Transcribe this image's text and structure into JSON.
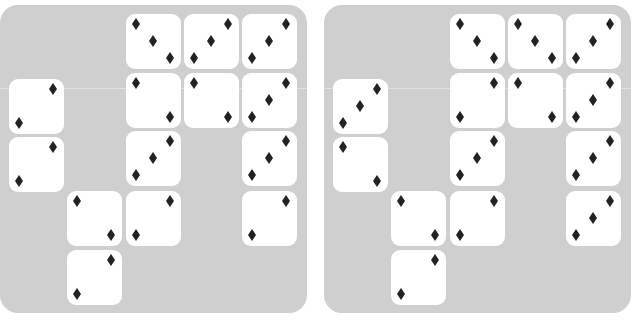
{
  "colors": {
    "panel_background": "#cfcfcf",
    "tile_background": "#ffffff",
    "pip_color": "#222222"
  },
  "pip_icon": "diamond-icon",
  "grid": {
    "columns_x": [
      9,
      67,
      126,
      184,
      242
    ],
    "rows_y": [
      9,
      68,
      126,
      186,
      245
    ],
    "col0_rows_y": [
      74,
      132
    ],
    "tile_size": 55
  },
  "panels": [
    {
      "name": "left",
      "caption": "",
      "tiles": [
        {
          "col": 2,
          "row": 0,
          "pattern": "diag-down-3"
        },
        {
          "col": 3,
          "row": 0,
          "pattern": "diag-up-3"
        },
        {
          "col": 4,
          "row": 0,
          "pattern": "diag-up-3"
        },
        {
          "col": 0,
          "row": 1,
          "pattern": "diag-up-2"
        },
        {
          "col": 2,
          "row": 1,
          "pattern": "diag-down-2"
        },
        {
          "col": 3,
          "row": 1,
          "pattern": "diag-down-2"
        },
        {
          "col": 4,
          "row": 1,
          "pattern": "diag-up-3"
        },
        {
          "col": 0,
          "row": 2,
          "pattern": "diag-up-2"
        },
        {
          "col": 2,
          "row": 2,
          "pattern": "diag-up-3"
        },
        {
          "col": 4,
          "row": 2,
          "pattern": "diag-up-3"
        },
        {
          "col": 1,
          "row": 3,
          "pattern": "diag-down-2"
        },
        {
          "col": 2,
          "row": 3,
          "pattern": "diag-up-2"
        },
        {
          "col": 4,
          "row": 3,
          "pattern": "diag-up-2"
        },
        {
          "col": 1,
          "row": 4,
          "pattern": "diag-up-2"
        }
      ]
    },
    {
      "name": "right",
      "caption": "",
      "tiles": [
        {
          "col": 2,
          "row": 0,
          "pattern": "diag-down-3"
        },
        {
          "col": 3,
          "row": 0,
          "pattern": "diag-down-3"
        },
        {
          "col": 4,
          "row": 0,
          "pattern": "diag-up-3"
        },
        {
          "col": 0,
          "row": 1,
          "pattern": "diag-up-3"
        },
        {
          "col": 2,
          "row": 1,
          "pattern": "diag-up-2"
        },
        {
          "col": 3,
          "row": 1,
          "pattern": "diag-down-2"
        },
        {
          "col": 4,
          "row": 1,
          "pattern": "diag-up-3"
        },
        {
          "col": 0,
          "row": 2,
          "pattern": "diag-down-2"
        },
        {
          "col": 2,
          "row": 2,
          "pattern": "diag-up-3"
        },
        {
          "col": 4,
          "row": 2,
          "pattern": "diag-up-3"
        },
        {
          "col": 1,
          "row": 3,
          "pattern": "diag-down-2"
        },
        {
          "col": 2,
          "row": 3,
          "pattern": "diag-up-2"
        },
        {
          "col": 4,
          "row": 3,
          "pattern": "diag-up-3"
        },
        {
          "col": 1,
          "row": 4,
          "pattern": "diag-up-2"
        }
      ]
    }
  ],
  "patterns": {
    "diag-down-3": [
      [
        10,
        10
      ],
      [
        27,
        27
      ],
      [
        44,
        44
      ]
    ],
    "diag-up-3": [
      [
        10,
        44
      ],
      [
        27,
        27
      ],
      [
        44,
        10
      ]
    ],
    "diag-down-2": [
      [
        10,
        10
      ],
      [
        44,
        44
      ]
    ],
    "diag-up-2": [
      [
        10,
        44
      ],
      [
        44,
        10
      ]
    ]
  }
}
